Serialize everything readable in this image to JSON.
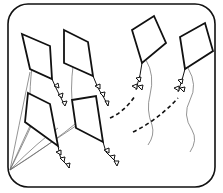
{
  "illustration": {
    "subject": "kites",
    "kite_count": 6,
    "colors": {
      "background": "#ffffff",
      "stroke": "#111111",
      "string": "#555555"
    }
  }
}
